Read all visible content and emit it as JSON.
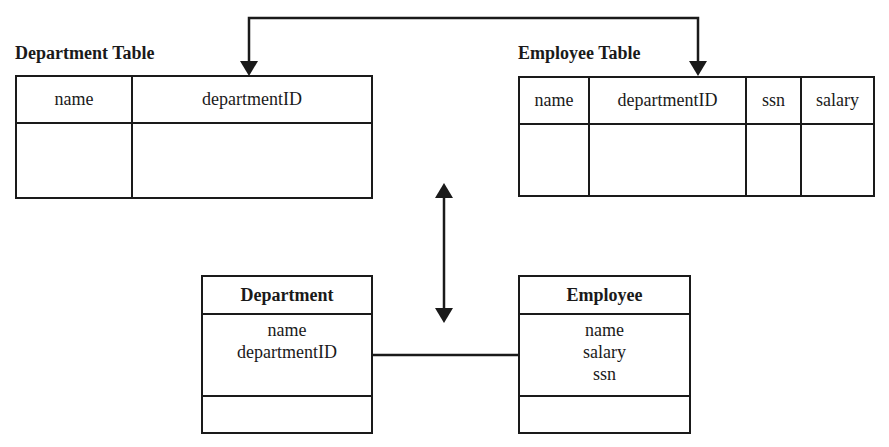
{
  "department_table": {
    "title": "Department Table",
    "columns": [
      {
        "header": "name",
        "value": ""
      },
      {
        "header": "departmentID",
        "value": ""
      }
    ]
  },
  "employee_table": {
    "title": "Employee Table",
    "columns": [
      {
        "header": "name",
        "value": ""
      },
      {
        "header": "departmentID",
        "value": ""
      },
      {
        "header": "ssn",
        "value": ""
      },
      {
        "header": "salary",
        "value": ""
      }
    ]
  },
  "department_class": {
    "name": "Department",
    "attributes": [
      "name",
      "departmentID"
    ],
    "operations": []
  },
  "employee_class": {
    "name": "Employee",
    "attributes": [
      "name",
      "salary",
      "ssn"
    ],
    "operations": []
  },
  "connectors": {
    "foreign_key_link": "departmentID → departmentID",
    "mapping_arrow": "bidirectional",
    "association": "Department — Employee"
  },
  "colors": {
    "line": "#1a1a1a",
    "background": "#ffffff"
  }
}
